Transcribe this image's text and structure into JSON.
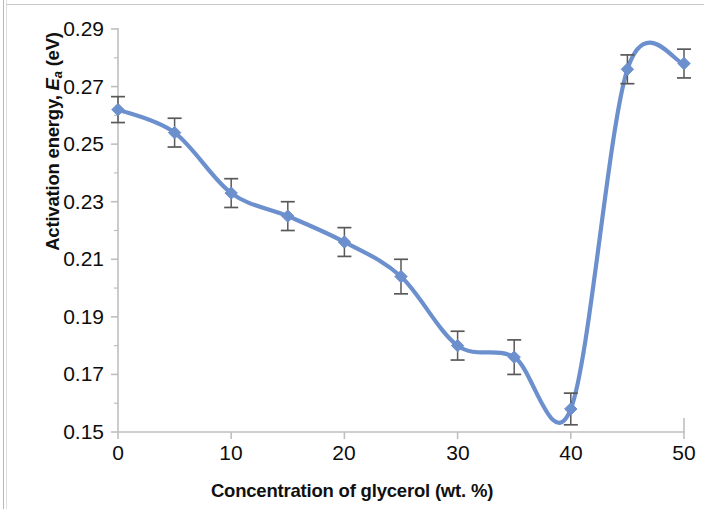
{
  "chart_data": {
    "type": "line",
    "title": "",
    "xlabel": "Concentration of glycerol (wt. %)",
    "ylabel": "Activation energy, Ea (eV)",
    "ylabel_parts": {
      "prefix": "Activation energy, ",
      "italic": "E",
      "subscript": "a",
      "suffix": " (eV)"
    },
    "x": [
      0,
      5,
      10,
      15,
      20,
      25,
      30,
      35,
      40,
      45,
      50
    ],
    "values": [
      0.262,
      0.254,
      0.233,
      0.225,
      0.216,
      0.204,
      0.18,
      0.176,
      0.158,
      0.276,
      0.278
    ],
    "error": [
      0.0045,
      0.005,
      0.005,
      0.005,
      0.005,
      0.006,
      0.005,
      0.006,
      0.0055,
      0.005,
      0.005
    ],
    "xlim": [
      0,
      50
    ],
    "ylim": [
      0.15,
      0.29
    ],
    "xticks": [
      0,
      10,
      20,
      30,
      40,
      50
    ],
    "xtick_labels": [
      "0",
      "10",
      "20",
      "30",
      "40",
      "50"
    ],
    "yticks": [
      0.15,
      0.17,
      0.19,
      0.21,
      0.23,
      0.25,
      0.27,
      0.29
    ],
    "ytick_labels": [
      "0.15",
      "0.17",
      "0.19",
      "0.21",
      "0.23",
      "0.25",
      "0.27",
      "0.29"
    ],
    "y_minor_ticks": [
      0.16,
      0.18,
      0.2,
      0.22,
      0.24,
      0.26,
      0.28
    ],
    "grid": false,
    "legend": null,
    "series_name": "Activation energy",
    "marker": "diamond",
    "smoothing": true,
    "colors": {
      "line": "#6C8FCD",
      "marker": "#6C8FCD",
      "error_bar": "#595959",
      "axis": "#bfbfbf",
      "text": "#0d0d0d",
      "background": "#ffffff"
    }
  }
}
